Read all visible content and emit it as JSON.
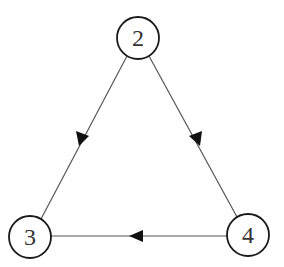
{
  "diagram": {
    "type": "directed-graph",
    "colors": {
      "edge": "#555555",
      "node_stroke": "#1a1a1a",
      "node_fill": "#ffffff",
      "arrowhead": "#111111",
      "label": "#333333"
    },
    "nodes": [
      {
        "id": "2",
        "label": "2",
        "cx": 138,
        "cy": 38,
        "r": 21
      },
      {
        "id": "3",
        "label": "3",
        "cx": 30,
        "cy": 237,
        "r": 21
      },
      {
        "id": "4",
        "label": "4",
        "cx": 248,
        "cy": 235,
        "r": 21
      }
    ],
    "edges": [
      {
        "from": "2",
        "to": "3",
        "arrow_position": "midpoint"
      },
      {
        "from": "2",
        "to": "4",
        "arrow_position": "midpoint"
      },
      {
        "from": "4",
        "to": "3",
        "arrow_position": "midpoint"
      }
    ]
  }
}
